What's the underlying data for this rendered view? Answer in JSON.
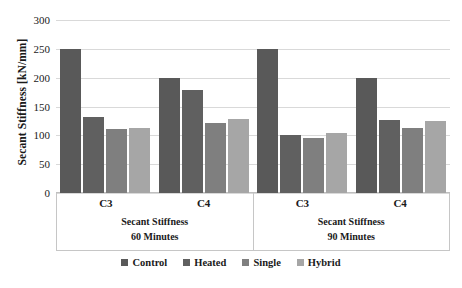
{
  "chart_data": {
    "type": "bar",
    "title": "",
    "xlabel": "",
    "ylabel": "Secant Stiffness [kN/mm]",
    "ylim": [
      0,
      300
    ],
    "yticks": [
      300,
      250,
      200,
      150,
      100,
      50,
      0
    ],
    "grid": true,
    "legend_position": "bottom",
    "categories": [
      "C3",
      "C4",
      "C3",
      "C4"
    ],
    "group_titles": [
      "Secant Stiffness 60 Minutes",
      "Secant Stiffness 90 Minutes"
    ],
    "panels": [
      {
        "line1": "Secant Stiffness",
        "line2": "60 Minutes",
        "categories": [
          "C3",
          "C4"
        ]
      },
      {
        "line1": "Secant Stiffness",
        "line2": "90 Minutes",
        "categories": [
          "C3",
          "C4"
        ]
      }
    ],
    "series": [
      {
        "name": "Control",
        "color": "#595959",
        "values": [
          250,
          200,
          250,
          200
        ]
      },
      {
        "name": "Heated",
        "color": "#606060",
        "values": [
          131,
          178,
          101,
          127
        ]
      },
      {
        "name": "Single",
        "color": "#7f7f7f",
        "values": [
          111,
          122,
          96,
          112
        ]
      },
      {
        "name": "Hybrid",
        "color": "#a6a6a6",
        "values": [
          113,
          128,
          104,
          125
        ]
      }
    ],
    "legend": [
      {
        "label": "Control",
        "color": "#595959"
      },
      {
        "label": "Heated",
        "color": "#606060"
      },
      {
        "label": "Single",
        "color": "#7f7f7f"
      },
      {
        "label": "Hybrid",
        "color": "#a6a6a6"
      }
    ]
  },
  "axis": {
    "gridline_color": "#d9d9d9",
    "baseline_color": "#bfbfbf",
    "box_border_color": "#c6c6c6"
  }
}
